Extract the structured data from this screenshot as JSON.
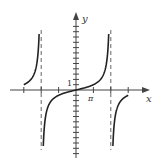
{
  "chart_data": {
    "type": "line",
    "title": "",
    "function": "y = tan(x/4)",
    "xlabel": "x",
    "ylabel": "y",
    "x_tick_label": "π",
    "y_tick_label": "1",
    "xlim": [
      -4.2,
      4.2
    ],
    "ylim": [
      -15,
      15
    ],
    "x_tick_spacing": "π",
    "y_tick_spacing": 1,
    "vertical_asymptotes": [
      "-2π",
      "2π"
    ],
    "grid": false,
    "legend": null,
    "branches": [
      {
        "name": "left-branch",
        "x_range": [
          "-3π",
          "-2π"
        ],
        "description": "rises from y=1 at x=-3π to +∞ near x=-2π"
      },
      {
        "name": "center-branch",
        "x_range": [
          "-2π",
          "2π"
        ],
        "description": "passes through origin, -∞ to +∞"
      },
      {
        "name": "right-branch",
        "x_range": [
          "2π",
          "3π"
        ],
        "description": "rises from -∞ near x=2π to y=-1 at x=3π"
      }
    ],
    "colors": {
      "curve": "#222222",
      "axis": "#444444",
      "asymptote": "#666666"
    }
  },
  "labels": {
    "x_axis": "x",
    "y_axis": "y",
    "pi_tick": "π",
    "one_tick": "1"
  }
}
